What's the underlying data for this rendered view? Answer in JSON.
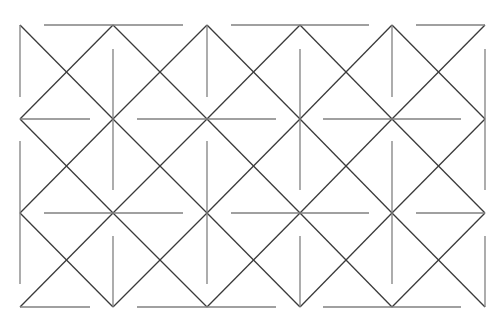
{
  "diagram": {
    "title": "",
    "colors": {
      "background": "#ffffff",
      "diagonal": "#3a3a3a",
      "orthogonal": "#808080"
    },
    "grid": {
      "xs": [
        20,
        113,
        207,
        300,
        392,
        485
      ],
      "ys": [
        25,
        119,
        213,
        307
      ]
    },
    "horizontal_segments": [
      {
        "y": 25,
        "spans": [
          [
            44,
            183
          ],
          [
            231,
            369
          ],
          [
            416,
            485
          ]
        ]
      },
      {
        "y": 119,
        "spans": [
          [
            20,
            90
          ],
          [
            137,
            276
          ],
          [
            323,
            461
          ]
        ]
      },
      {
        "y": 213,
        "spans": [
          [
            44,
            183
          ],
          [
            231,
            369
          ],
          [
            416,
            485
          ]
        ]
      },
      {
        "y": 307,
        "spans": [
          [
            20,
            90
          ],
          [
            137,
            276
          ],
          [
            323,
            461
          ]
        ]
      }
    ],
    "vertical_segments": [
      {
        "x": 20,
        "spans": [
          [
            25,
            97
          ],
          [
            141,
            284
          ]
        ]
      },
      {
        "x": 113,
        "spans": [
          [
            49,
            190
          ],
          [
            236,
            307
          ]
        ]
      },
      {
        "x": 207,
        "spans": [
          [
            25,
            97
          ],
          [
            141,
            284
          ]
        ]
      },
      {
        "x": 300,
        "spans": [
          [
            49,
            190
          ],
          [
            236,
            307
          ]
        ]
      },
      {
        "x": 392,
        "spans": [
          [
            25,
            97
          ],
          [
            141,
            284
          ]
        ]
      },
      {
        "x": 485,
        "spans": [
          [
            49,
            190
          ],
          [
            236,
            307
          ]
        ]
      }
    ]
  }
}
